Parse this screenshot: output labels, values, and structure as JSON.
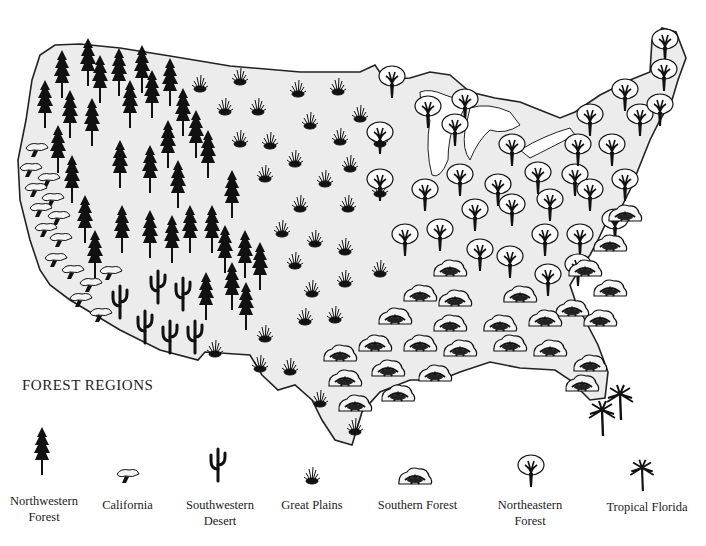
{
  "map": {
    "title": "FOREST REGIONS",
    "subject": "United States forest regions",
    "land_fill": "#ececec",
    "outline_color": "#222222",
    "state_border_color": "#ffffff",
    "background": "#ffffff"
  },
  "legend": {
    "title": "FOREST REGIONS",
    "items": [
      {
        "id": "northwestern",
        "icon": "conifer-tree-icon",
        "label": "Northwestern\nForest"
      },
      {
        "id": "california",
        "icon": "california-oak-icon",
        "label": "California"
      },
      {
        "id": "southwestern",
        "icon": "saguaro-cactus-icon",
        "label": "Southwestern\nDesert"
      },
      {
        "id": "great-plains",
        "icon": "grass-tuft-icon",
        "label": "Great Plains"
      },
      {
        "id": "southern",
        "icon": "southern-shrub-tree-icon",
        "label": "Southern Forest"
      },
      {
        "id": "northeastern",
        "icon": "deciduous-tree-icon",
        "label": "Northeastern\nForest"
      },
      {
        "id": "tropical",
        "icon": "palm-tree-icon",
        "label": "Tropical Florida"
      }
    ]
  }
}
